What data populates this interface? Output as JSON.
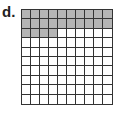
{
  "label": "d.",
  "grid": {
    "rows": 10,
    "cols": 10,
    "shaded_count": 24,
    "total": 100,
    "shaded_color": "#b5b5b5",
    "unshaded_color": "#ffffff",
    "line_color": "#333333"
  }
}
